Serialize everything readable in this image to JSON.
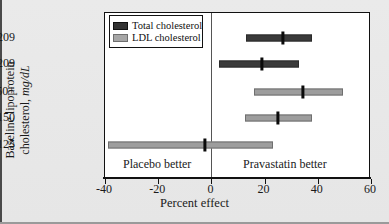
{
  "chart_data": {
    "type": "bar",
    "title": "",
    "xlabel": "Percent effect",
    "ylabel": "Baseline lipoprotein cholesterol, mg/dL",
    "ylabel_main": "Baseline lipoprotein",
    "ylabel_sub": "cholesterol,",
    "ylabel_units": "mg/dL",
    "xlim": [
      -40,
      60
    ],
    "xticks": [
      -40,
      -20,
      0,
      20,
      40,
      60
    ],
    "xticklabels": [
      "-40",
      "-20",
      "0",
      "20",
      "40",
      "60"
    ],
    "grid": false,
    "reference_line": 0,
    "categories": [
      "=>209",
      "<209",
      "150+",
      "125-150",
      "<125"
    ],
    "series": [
      {
        "name": "Total cholesterol",
        "color": "#3a3a3a",
        "points": [
          {
            "category": ">209",
            "estimate": 27,
            "low": 13,
            "high": 38
          },
          {
            "category": "<209",
            "estimate": 19,
            "low": 3,
            "high": 33
          }
        ]
      },
      {
        "name": "LDL cholesterol",
        "color": "#9d9d9d",
        "points": [
          {
            "category": "150+",
            "estimate": 34.5,
            "low": 16,
            "high": 49.5
          },
          {
            "category": "125-150",
            "estimate": 25,
            "low": 12.5,
            "high": 38
          },
          {
            "category": "<125",
            "estimate": -2.5,
            "low": -39,
            "high": 23
          }
        ]
      }
    ],
    "rows": [
      {
        "label": ">209",
        "series": "Total cholesterol",
        "style": "dark",
        "low": 13,
        "high": 38,
        "estimate": 27
      },
      {
        "label": "<209",
        "series": "Total cholesterol",
        "style": "dark",
        "low": 3,
        "high": 33,
        "estimate": 19
      },
      {
        "label": "150+",
        "series": "LDL cholesterol",
        "style": "light",
        "low": 16,
        "high": 49.5,
        "estimate": 34.5
      },
      {
        "label": "125–150",
        "series": "LDL cholesterol",
        "style": "light",
        "low": 12.5,
        "high": 38,
        "estimate": 25
      },
      {
        "label": "<125",
        "series": "LDL cholesterol",
        "style": "light",
        "low": -39,
        "high": 23,
        "estimate": -2.5
      }
    ],
    "annotations": [
      {
        "text": "Placebo better",
        "x": -20
      },
      {
        "text": "Pravastatin better",
        "x": 28
      }
    ],
    "legend": {
      "position": "top-left",
      "entries": [
        {
          "label": "Total cholesterol",
          "color": "#333333"
        },
        {
          "label": "LDL cholesterol",
          "color": "#a6a6a6"
        }
      ]
    }
  }
}
